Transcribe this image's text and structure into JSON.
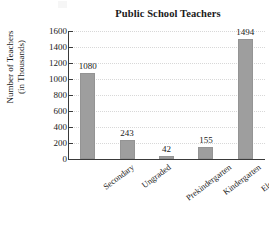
{
  "chart_data": {
    "type": "bar",
    "title": "Public School Teachers",
    "xlabel": "",
    "ylabel": "Number of Teachers (in Thousands)",
    "ylabel_lines": [
      "Number of Teachers",
      "(in Thousands)"
    ],
    "categories": [
      "Secondary",
      "Ungraded",
      "Prekindergarten",
      "Kindergarten",
      "Elementary"
    ],
    "values": [
      1080,
      243,
      42,
      155,
      1494
    ],
    "value_labels": [
      "1080",
      "243",
      "42",
      "155",
      "1494"
    ],
    "ylim": [
      0,
      1600
    ],
    "ytick_values": [
      0,
      200,
      400,
      600,
      800,
      1000,
      1200,
      1400,
      1600
    ],
    "ytick_labels": [
      "0",
      "200",
      "400",
      "600",
      "800",
      "1000",
      "1200",
      "1400",
      "1600"
    ],
    "grid": true,
    "legend": false,
    "bar_color": "#9e9e9e",
    "axis_color": "#3a3a3a",
    "grid_color": "#d8d8d8",
    "text_color": "#1a1a1a"
  }
}
